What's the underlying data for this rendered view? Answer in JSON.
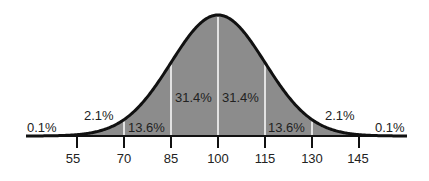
{
  "chart_data": {
    "type": "area",
    "title": "",
    "xlabel": "",
    "ylabel": "",
    "x_ticks": [
      55,
      70,
      85,
      100,
      115,
      130,
      145
    ],
    "mean": 100,
    "sd": 15,
    "bands": [
      {
        "range": "<55",
        "percent": "0.1%"
      },
      {
        "range": "55-70",
        "percent": "2.1%"
      },
      {
        "range": "70-85",
        "percent": "13.6%"
      },
      {
        "range": "85-100",
        "percent": "31.4%"
      },
      {
        "range": "100-115",
        "percent": "31.4%"
      },
      {
        "range": "115-130",
        "percent": "13.6%"
      },
      {
        "range": "130-145",
        "percent": "2.1%"
      },
      {
        "range": ">145",
        "percent": "0.1%"
      }
    ],
    "fill_color": "#8c8c8c",
    "curve_color": "#111111",
    "grid": false,
    "legend": "none"
  },
  "labels": {
    "tail_left": "0.1%",
    "band_55_70": "2.1%",
    "band_70_85": "13.6%",
    "band_85_100": "31.4%",
    "band_100_115": "31.4%",
    "band_115_130": "13.6%",
    "band_130_145": "2.1%",
    "tail_right": "0.1%",
    "ticks": [
      "55",
      "70",
      "85",
      "100",
      "115",
      "130",
      "145"
    ]
  }
}
